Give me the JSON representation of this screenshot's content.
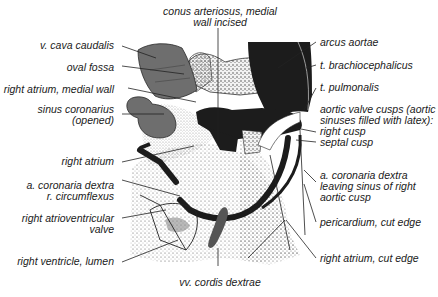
{
  "figure": {
    "colors": {
      "gray_structure": "#6e6e6e",
      "black_structure": "#1c1c1c",
      "line": "#222222",
      "stipple": "#555555",
      "background": "#ffffff"
    },
    "labels_top": {
      "conus_line1": "conus arteriosus, medial",
      "conus_line2": "wall incised"
    },
    "labels_left": [
      {
        "text": "v. cava caudalis"
      },
      {
        "text": "oval fossa"
      },
      {
        "text": "right atrium, medial wall"
      },
      {
        "line1": "sinus coronarius",
        "line2": "(opened)"
      },
      {
        "text": "right atrium"
      },
      {
        "line1": "a. coronaria dextra",
        "line2": "r. circumflexus"
      },
      {
        "line1": "right atrioventricular",
        "line2": "valve"
      },
      {
        "text": "right ventricle, lumen"
      }
    ],
    "labels_right": [
      {
        "text": "arcus aortae"
      },
      {
        "text": "t. brachiocephalicus"
      },
      {
        "text": "t. pulmonalis"
      },
      {
        "line1": "aortic valve cusps (aortic",
        "line2": "sinuses filled with latex):",
        "line3": "right cusp",
        "line4": "septal cusp"
      },
      {
        "line1": "a. coronaria dextra",
        "line2": "leaving sinus of right",
        "line3": "aortic cusp"
      },
      {
        "text": "pericardium, cut edge"
      },
      {
        "text": "right atrium, cut edge"
      }
    ],
    "labels_bottom": {
      "vv_cordis": "vv. cordis dextrae"
    }
  }
}
